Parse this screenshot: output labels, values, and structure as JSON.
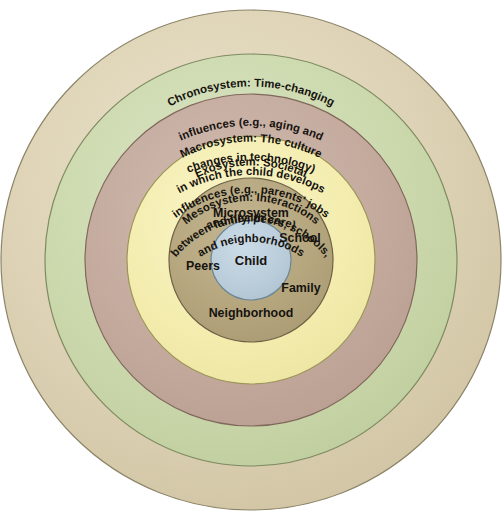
{
  "diagram": {
    "background_color": "#ffffff",
    "center": {
      "x": 251,
      "y": 260
    },
    "rings": [
      {
        "id": "chronosystem",
        "name": "Chronosystem",
        "radius": 250,
        "fill": "#ddd2b4",
        "fill_light": "#e8e0c8",
        "stroke": "#8c8468",
        "lines": [
          "Chronosystem: Time-changing",
          "influences (e.g., aging and",
          "changes in technology)"
        ]
      },
      {
        "id": "macrosystem",
        "name": "Macrosystem",
        "radius": 206,
        "fill": "#cbd8ac",
        "fill_light": "#d9e3c0",
        "stroke": "#7f8a62",
        "lines": [
          "Macrosystem: The culture",
          "in which the child develops"
        ]
      },
      {
        "id": "exosystem",
        "name": "Exosystem",
        "radius": 166,
        "fill": "#c4ab9e",
        "fill_light": "#cfb9ad",
        "stroke": "#80675c",
        "lines": [
          "Exosystem: Societal",
          "influences (e.g., parents' jobs",
          "and health care)"
        ]
      },
      {
        "id": "mesosystem",
        "name": "Mesosystem",
        "radius": 124,
        "fill": "#f4edaf",
        "fill_light": "#f8f3c6",
        "stroke": "#9c9559",
        "lines": [
          "Mesosystem: Interactions",
          "between family, peers, schools,",
          "and neighborhoods"
        ]
      },
      {
        "id": "microsystem",
        "name": "Microsystem",
        "radius": 82,
        "fill": "#b5a67e",
        "fill_light": "#c2b48f",
        "stroke": "#6e6246",
        "lines": []
      },
      {
        "id": "child",
        "name": "Child",
        "radius": 40,
        "fill": "#b9ccd9",
        "fill_light": "#cadbe6",
        "stroke": "#6b8495",
        "lines": []
      }
    ],
    "microsystem_labels": {
      "ring_title": "Microsystem",
      "school": "School",
      "family": "Family",
      "neighborhood": "Neighborhood",
      "peers": "Peers"
    },
    "core_label": "Child"
  }
}
